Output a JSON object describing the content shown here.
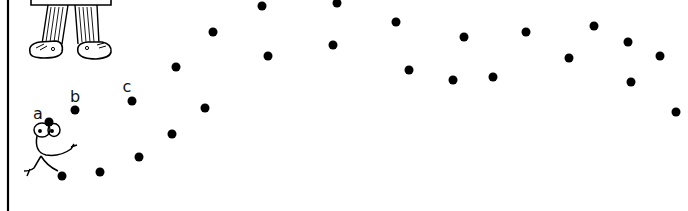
{
  "puzzle": {
    "type": "connect-the-dots",
    "ink_color": "#000000",
    "background": "#ffffff",
    "labels": [
      {
        "text": "a",
        "x": 38,
        "y": 114
      },
      {
        "text": "b",
        "x": 75,
        "y": 97
      },
      {
        "text": "c",
        "x": 127,
        "y": 87
      }
    ],
    "dots": [
      {
        "x": 49,
        "y": 122
      },
      {
        "x": 75,
        "y": 110
      },
      {
        "x": 132,
        "y": 101
      },
      {
        "x": 176,
        "y": 67
      },
      {
        "x": 213,
        "y": 32
      },
      {
        "x": 262,
        "y": 6
      },
      {
        "x": 337,
        "y": 3
      },
      {
        "x": 396,
        "y": 22
      },
      {
        "x": 464,
        "y": 37
      },
      {
        "x": 526,
        "y": 32
      },
      {
        "x": 594,
        "y": 26
      },
      {
        "x": 628,
        "y": 42
      },
      {
        "x": 660,
        "y": 56
      },
      {
        "x": 631,
        "y": 82
      },
      {
        "x": 676,
        "y": 112
      },
      {
        "x": 569,
        "y": 58
      },
      {
        "x": 493,
        "y": 77
      },
      {
        "x": 453,
        "y": 80
      },
      {
        "x": 409,
        "y": 70
      },
      {
        "x": 333,
        "y": 45
      },
      {
        "x": 268,
        "y": 56
      },
      {
        "x": 205,
        "y": 108
      },
      {
        "x": 172,
        "y": 134
      },
      {
        "x": 139,
        "y": 157
      },
      {
        "x": 100,
        "y": 172
      },
      {
        "x": 62,
        "y": 176
      }
    ]
  }
}
